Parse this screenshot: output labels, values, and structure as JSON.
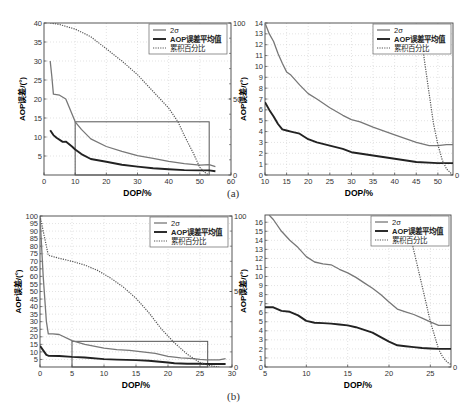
{
  "captions": {
    "a": "(a)",
    "b": "(b)"
  },
  "legend": {
    "items": [
      {
        "label": "2σ",
        "style": "solid-thin",
        "color": "#777777"
      },
      {
        "label": "AOP误差平均值",
        "style": "solid-thick",
        "color": "#222222"
      },
      {
        "label": "累积百分比",
        "style": "dotted",
        "color": "#555555"
      }
    ]
  },
  "colors": {
    "sigma": "#777777",
    "mean": "#222222",
    "cumulative": "#555555",
    "grid": "#d0d0d0",
    "axis": "#444444",
    "zoom_box": "#555555"
  },
  "chart_data": [
    {
      "id": "a-left",
      "type": "line",
      "title": "",
      "xlabel": "DOP/%",
      "ylabel": "AOP误差/(°)",
      "y2label": "累积百分比/%",
      "box": {
        "x": 44,
        "y": 23,
        "w": 187,
        "h": 152
      },
      "xlim": [
        0,
        60
      ],
      "ylim": [
        0,
        40
      ],
      "y2lim": [
        0,
        100
      ],
      "xticks": [
        0,
        10,
        20,
        30,
        40,
        50,
        60
      ],
      "yticks": [
        5,
        10,
        15,
        20,
        25,
        30,
        35,
        40
      ],
      "y2ticks": [
        0,
        50,
        100
      ],
      "grid": true,
      "legend_position": "upper right",
      "zoom_rect": {
        "x0": 10,
        "x1": 53,
        "y0": 0,
        "y1": 14
      },
      "series": [
        {
          "name": "2σ",
          "axis": "left",
          "x": [
            2,
            2.5,
            3,
            5,
            7,
            8,
            10,
            12,
            15,
            20,
            25,
            30,
            35,
            40,
            45,
            50,
            53,
            55
          ],
          "y": [
            30,
            26,
            21.3,
            21,
            20,
            18,
            14,
            12,
            9.5,
            7.5,
            6.2,
            5.1,
            4.4,
            3.6,
            3,
            2.6,
            2.7,
            2.2
          ]
        },
        {
          "name": "AOP误差平均值",
          "axis": "left",
          "x": [
            2,
            3,
            4,
            6,
            7,
            9,
            10,
            12,
            15,
            20,
            25,
            30,
            35,
            40,
            45,
            50,
            53,
            55
          ],
          "y": [
            11.8,
            10.5,
            9.8,
            8.7,
            8.8,
            7.5,
            6.7,
            5.5,
            4.2,
            3.5,
            2.7,
            2.2,
            1.8,
            1.5,
            1.3,
            1.2,
            1.2,
            1.0
          ]
        },
        {
          "name": "累积百分比",
          "axis": "right",
          "x": [
            2,
            5,
            10,
            15,
            20,
            25,
            30,
            35,
            40,
            43,
            45,
            48,
            50,
            52,
            53
          ],
          "y": [
            100,
            99,
            96,
            91,
            83,
            75,
            66,
            55,
            44,
            35,
            26,
            14,
            5,
            1,
            0
          ]
        }
      ]
    },
    {
      "id": "a-right",
      "type": "line",
      "title": "",
      "xlabel": "DOP/%",
      "ylabel": "AOP误差/(°)",
      "box": {
        "x": 265,
        "y": 23,
        "w": 188,
        "h": 152
      },
      "xlim": [
        10,
        53.5
      ],
      "ylim": [
        0,
        14
      ],
      "y2lim": [
        0,
        30
      ],
      "xticks": [
        10,
        15,
        20,
        25,
        30,
        35,
        40,
        45,
        50
      ],
      "yticks": [
        0,
        1,
        2,
        3,
        4,
        5,
        6,
        7,
        8,
        9,
        10,
        11,
        12,
        13,
        14
      ],
      "y2ticks": [
        0
      ],
      "grid": true,
      "legend_position": "upper right",
      "series": [
        {
          "name": "2σ",
          "axis": "left",
          "x": [
            10,
            11,
            12,
            13,
            14,
            15,
            16,
            18,
            20,
            22,
            25,
            28,
            30,
            32,
            35,
            40,
            45,
            48,
            50,
            52,
            53.5
          ],
          "y": [
            14,
            13,
            12.3,
            11.2,
            10.3,
            9.5,
            9.2,
            8.3,
            7.5,
            7,
            6.2,
            5.5,
            5.1,
            4.9,
            4.4,
            3.7,
            3,
            2.7,
            2.7,
            2.8,
            2.8
          ]
        },
        {
          "name": "AOP误差平均值",
          "axis": "left",
          "x": [
            10,
            11,
            12,
            13,
            14,
            15,
            16,
            18,
            20,
            22,
            25,
            28,
            30,
            35,
            40,
            45,
            50,
            53.5
          ],
          "y": [
            6.7,
            6,
            5.4,
            4.7,
            4.2,
            4.1,
            4.0,
            3.8,
            3.3,
            3,
            2.7,
            2.4,
            2.1,
            1.8,
            1.5,
            1.2,
            1.1,
            1.1
          ]
        },
        {
          "name": "累积百分比",
          "axis": "right",
          "x": [
            46,
            47,
            48,
            49,
            50,
            51,
            52,
            53,
            53.5
          ],
          "y": [
            28,
            22,
            16,
            10,
            6,
            3,
            1.2,
            0.4,
            0
          ]
        }
      ]
    },
    {
      "id": "b-left",
      "type": "line",
      "title": "",
      "xlabel": "DOP/%",
      "ylabel": "AOP误差/(°)",
      "y2label": "累积百分比/%",
      "box": {
        "x": 40,
        "y": 216,
        "w": 192,
        "h": 151
      },
      "xlim": [
        0,
        30
      ],
      "ylim": [
        0,
        100
      ],
      "y2lim": [
        0,
        100
      ],
      "xticks": [
        0,
        5,
        10,
        15,
        20,
        25,
        30
      ],
      "yticks": [
        5,
        10,
        15,
        20,
        25,
        30,
        35,
        40,
        45,
        50,
        55,
        60,
        65,
        70,
        75,
        80,
        85,
        90,
        95,
        100
      ],
      "y2ticks": [
        0,
        50,
        100
      ],
      "grid": true,
      "legend_position": "upper right",
      "zoom_rect": {
        "x0": 5,
        "x1": 26.2,
        "y0": 0,
        "y1": 17
      },
      "series": [
        {
          "name": "2σ",
          "axis": "left",
          "x": [
            0,
            0.5,
            1,
            1.3,
            2,
            3,
            5,
            7,
            10,
            12,
            14,
            16,
            18,
            20,
            22,
            24,
            25,
            26,
            28,
            29
          ],
          "y": [
            100,
            60,
            30,
            22,
            22,
            21.5,
            17.5,
            15,
            12.5,
            11.5,
            11,
            10,
            9,
            7,
            6,
            5.5,
            5,
            4.7,
            4.7,
            5.5
          ]
        },
        {
          "name": "AOP误差平均值",
          "axis": "left",
          "x": [
            0,
            0.5,
            1,
            1.3,
            3,
            5,
            7,
            10,
            12,
            15,
            17,
            20,
            21,
            23,
            25,
            26,
            27,
            29
          ],
          "y": [
            14,
            11,
            8,
            7.5,
            7.3,
            6.7,
            6.3,
            5.2,
            4.9,
            4.6,
            4.2,
            3,
            2.5,
            2.2,
            2.1,
            2,
            2,
            2
          ]
        },
        {
          "name": "累积百分比",
          "axis": "right",
          "x": [
            0,
            1,
            1.3,
            3,
            5,
            7,
            9,
            11,
            13,
            15,
            17,
            19,
            21,
            23,
            25,
            26,
            27,
            28
          ],
          "y": [
            100,
            80,
            74,
            72,
            70,
            67.5,
            64,
            59,
            53,
            45.5,
            36,
            25,
            16,
            8.5,
            3,
            1.5,
            0.5,
            0
          ]
        }
      ]
    },
    {
      "id": "b-right",
      "type": "line",
      "title": "",
      "xlabel": "DOP/%",
      "ylabel": "AOP误差/(°)",
      "box": {
        "x": 265,
        "y": 215,
        "w": 186,
        "h": 152
      },
      "xlim": [
        5,
        27.5
      ],
      "ylim": [
        0,
        16.8
      ],
      "y2lim": [
        0,
        30
      ],
      "xticks": [
        5,
        10,
        15,
        20,
        25
      ],
      "yticks": [
        0,
        1,
        2,
        3,
        4,
        5,
        6,
        7,
        8,
        9,
        10,
        11,
        12,
        13,
        14,
        15,
        16
      ],
      "y2ticks": [
        0
      ],
      "grid": true,
      "legend_position": "upper right",
      "series": [
        {
          "name": "2σ",
          "axis": "left",
          "x": [
            5.5,
            6,
            7,
            8,
            9,
            10,
            11,
            12,
            13,
            14,
            15,
            16,
            17,
            18,
            19,
            20,
            21,
            22,
            23,
            24,
            25,
            26,
            27,
            27.5
          ],
          "y": [
            16.8,
            16.3,
            15,
            14,
            13.2,
            12.2,
            11.6,
            11.4,
            11.3,
            10.8,
            10.4,
            9.9,
            9.3,
            8.7,
            8,
            7.2,
            6.4,
            6.1,
            5.8,
            5.4,
            5,
            4.6,
            4.6,
            4.6
          ]
        },
        {
          "name": "AOP误差平均值",
          "axis": "left",
          "x": [
            5,
            6,
            7,
            8,
            9,
            10,
            11,
            12,
            13,
            14,
            15,
            16,
            17,
            18,
            19,
            20,
            21,
            22,
            23,
            24,
            25,
            26,
            27,
            27.5
          ],
          "y": [
            6.6,
            6.6,
            6.2,
            6.1,
            5.7,
            5.1,
            4.9,
            4.85,
            4.8,
            4.7,
            4.6,
            4.4,
            4.1,
            3.8,
            3.3,
            2.8,
            2.4,
            2.3,
            2.2,
            2.1,
            2.05,
            2,
            2,
            2
          ]
        },
        {
          "name": "累积百分比",
          "axis": "right",
          "x": [
            22.3,
            23,
            24,
            25,
            26,
            26.5,
            27,
            27.5
          ],
          "y": [
            28,
            23,
            16,
            9,
            3.5,
            2,
            1,
            0.5
          ]
        }
      ]
    }
  ]
}
